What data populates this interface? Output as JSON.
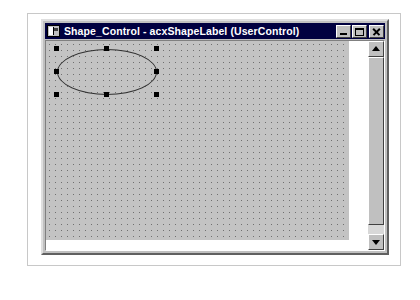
{
  "window": {
    "title": "Shape_Control - acxShapeLabel (UserControl)",
    "icon": "usercontrol-icon",
    "caption_buttons": [
      {
        "name": "minimize",
        "label": "Minimize"
      },
      {
        "name": "maximize",
        "label": "Maximize"
      },
      {
        "name": "close",
        "label": "Close"
      }
    ]
  },
  "design_surface": {
    "name": "usercontrol-design-grid",
    "grid_spacing_px": 6,
    "background_color": "#c3c3c3",
    "dot_color": "#707070",
    "selected_shape": {
      "type": "ellipse",
      "name": "shape-ellipse",
      "stroke_color": "#303030",
      "fill": "none",
      "selected": true,
      "handle_color": "#000000",
      "handles": [
        {
          "name": "handle-top-left",
          "x": 8,
          "y": 5
        },
        {
          "name": "handle-top-center",
          "x": 58,
          "y": 5
        },
        {
          "name": "handle-top-right",
          "x": 108,
          "y": 5
        },
        {
          "name": "handle-middle-left",
          "x": 8,
          "y": 28
        },
        {
          "name": "handle-middle-right",
          "x": 108,
          "y": 28
        },
        {
          "name": "handle-bottom-left",
          "x": 8,
          "y": 51
        },
        {
          "name": "handle-bottom-center",
          "x": 58,
          "y": 51
        },
        {
          "name": "handle-bottom-right",
          "x": 108,
          "y": 51
        }
      ]
    }
  },
  "scrollbar": {
    "orientation": "vertical",
    "up_arrow": "scroll-up-arrow",
    "down_arrow": "scroll-down-arrow",
    "thumb": "scroll-thumb",
    "thumb_position": "top"
  },
  "colors": {
    "titlebar": "#000040",
    "titlebar_text": "#ffffff",
    "face": "#c0c0c0",
    "client": "#ffffff",
    "surface": "#c3c3c3"
  }
}
